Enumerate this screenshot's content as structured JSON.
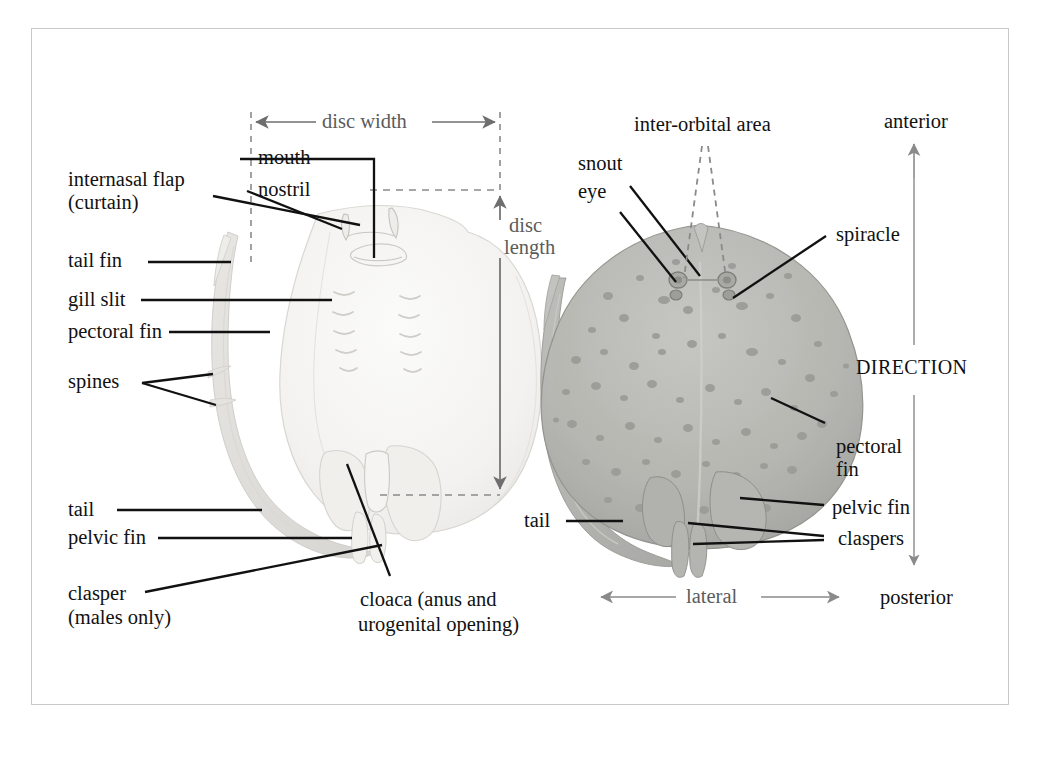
{
  "figure": {
    "border_color": "#c9c9c9",
    "background": "#ffffff",
    "leader_color": "#111111",
    "dimension_color": "#6e6e6e",
    "specimen_ventral_fill": "#f2f1ef",
    "specimen_dorsal_fill": "#b8b8b4"
  },
  "dimensions": {
    "disc_width": "disc width",
    "disc_length_line1": "disc",
    "disc_length_line2": "length"
  },
  "direction": {
    "title": "DIRECTION",
    "anterior": "anterior",
    "posterior": "posterior",
    "lateral": "lateral"
  },
  "ventral_labels": [
    {
      "id": "internasal-flap",
      "line1": "internasal flap",
      "line2": "(curtain)"
    },
    {
      "id": "tail-fin",
      "line1": "tail fin"
    },
    {
      "id": "gill-slit",
      "line1": "gill slit"
    },
    {
      "id": "pectoral-fin",
      "line1": "pectoral fin"
    },
    {
      "id": "spines",
      "line1": "spines"
    },
    {
      "id": "tail",
      "line1": "tail"
    },
    {
      "id": "pelvic-fin",
      "line1": "pelvic fin"
    },
    {
      "id": "clasper",
      "line1": "clasper",
      "line2": "(males only)"
    },
    {
      "id": "mouth",
      "line1": "mouth"
    },
    {
      "id": "nostril",
      "line1": "nostril"
    },
    {
      "id": "cloaca",
      "line1": "cloaca (anus and",
      "line2": "urogenital opening)"
    }
  ],
  "dorsal_labels": [
    {
      "id": "inter-orbital-area",
      "line1": "inter-orbital area"
    },
    {
      "id": "snout",
      "line1": "snout"
    },
    {
      "id": "eye",
      "line1": "eye"
    },
    {
      "id": "spiracle",
      "line1": "spiracle"
    },
    {
      "id": "pectoral-fin",
      "line1": "pectoral",
      "line2": "fin"
    },
    {
      "id": "pelvic-fin",
      "line1": "pelvic fin"
    },
    {
      "id": "claspers",
      "line1": "claspers"
    },
    {
      "id": "tail",
      "line1": "tail"
    }
  ]
}
